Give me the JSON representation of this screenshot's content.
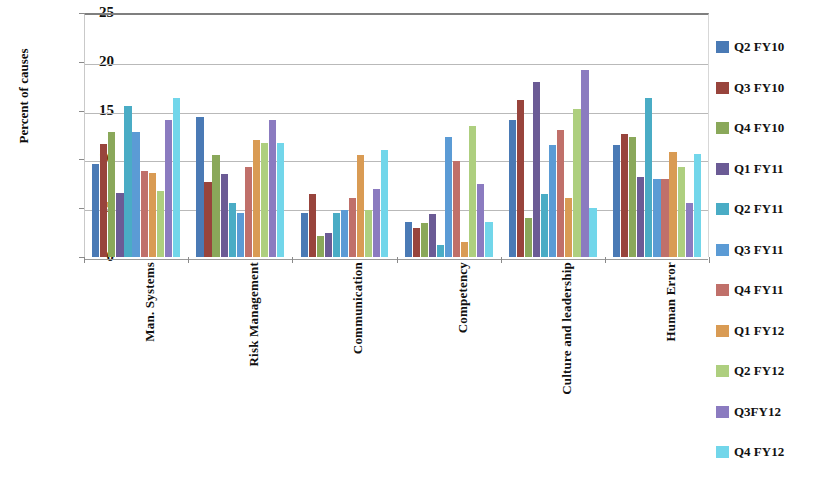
{
  "chart_data": {
    "type": "bar",
    "title": "",
    "xlabel": "",
    "ylabel": "Percent of causes",
    "ylim": [
      0,
      25
    ],
    "yticks": [
      0,
      5,
      10,
      15,
      20,
      25
    ],
    "grid": true,
    "legend_position": "right",
    "orientation": "vertical-grouped",
    "categories": [
      "Man. Systems",
      "Risk Management",
      "Communication",
      "Competency",
      "Culture and leadership",
      "Human Error"
    ],
    "series": [
      {
        "name": "Q2 FY10",
        "color": "#4a7ab5",
        "values": [
          9.5,
          14.3,
          4.5,
          3.6,
          14.0,
          11.5
        ]
      },
      {
        "name": "Q3 FY10",
        "color": "#98443c",
        "values": [
          11.6,
          7.7,
          6.5,
          3.0,
          16.1,
          12.6
        ]
      },
      {
        "name": "Q4 FY10",
        "color": "#8aa85a",
        "values": [
          12.8,
          10.5,
          2.2,
          3.5,
          4.0,
          12.3
        ]
      },
      {
        "name": "Q1 FY11",
        "color": "#6b5b95",
        "values": [
          6.6,
          8.5,
          2.5,
          4.4,
          17.9,
          8.2
        ]
      },
      {
        "name": "Q2 FY11",
        "color": "#4aacc5",
        "values": [
          15.5,
          5.5,
          4.5,
          1.2,
          6.5,
          16.3
        ]
      },
      {
        "name": "Q3 FY11",
        "color": "#5b9bd5",
        "values": [
          12.8,
          4.5,
          4.8,
          12.3,
          11.5,
          8.0
        ]
      },
      {
        "name": "Q4 FY11",
        "color": "#c0706a",
        "values": [
          8.8,
          9.2,
          6.0,
          9.8,
          13.0,
          8.0
        ]
      },
      {
        "name": "Q1 FY12",
        "color": "#d99b54",
        "values": [
          8.6,
          12.0,
          10.5,
          1.5,
          6.0,
          10.8
        ]
      },
      {
        "name": "Q2 FY12",
        "color": "#aecf7f",
        "values": [
          6.8,
          11.7,
          4.8,
          13.4,
          15.2,
          9.2
        ]
      },
      {
        "name": "Q3FY12",
        "color": "#8munch",
        "values": [
          14.0,
          14.0,
          7.0,
          7.5,
          19.2,
          5.5
        ]
      },
      {
        "name": "Q4 FY12",
        "color": "#72d6ea",
        "values": [
          16.3,
          11.7,
          11.0,
          3.6,
          5.0,
          10.6
        ]
      }
    ],
    "legend": [
      {
        "label": "Q2 FY10",
        "color": "#4a7ab5"
      },
      {
        "label": "Q3 FY10",
        "color": "#98443c"
      },
      {
        "label": "Q4 FY10",
        "color": "#8aa85a"
      },
      {
        "label": "Q1 FY11",
        "color": "#6b5b95"
      },
      {
        "label": "Q2 FY11",
        "color": "#4aacc5"
      },
      {
        "label": "Q3 FY11",
        "color": "#5b9bd5"
      },
      {
        "label": "Q4 FY11",
        "color": "#c0706a"
      },
      {
        "label": "Q1 FY12",
        "color": "#d99b54"
      },
      {
        "label": "Q2 FY12",
        "color": "#aecf7f"
      },
      {
        "label": "Q3FY12",
        "color": "#8b7bc0"
      },
      {
        "label": "Q4 FY12",
        "color": "#72d6ea"
      }
    ]
  }
}
